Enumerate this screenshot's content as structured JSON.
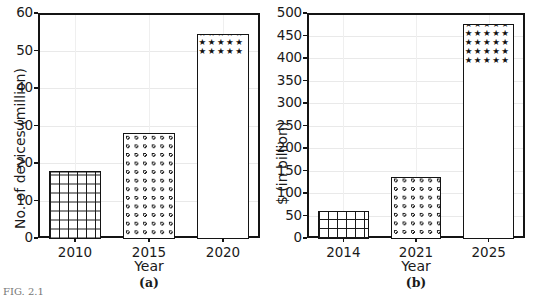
{
  "figure": {
    "background": "#ffffff",
    "axis_color": "#141414",
    "grid_color": "#e9e9e9",
    "bottom_fragment": "FIG. 2.1"
  },
  "chart_data": [
    {
      "id": "a",
      "type": "bar",
      "title": "",
      "panel_caption": "(a)",
      "categories": [
        "2010",
        "2015",
        "2020"
      ],
      "values": [
        18,
        28,
        54.5
      ],
      "xlabel": "Year",
      "ylabel": "No. of devices (million)",
      "ylim": [
        0,
        60
      ],
      "yticks": [
        0,
        10,
        20,
        30,
        40,
        50,
        60
      ],
      "ytick_labels": [
        "0",
        "10",
        "20",
        "30",
        "40",
        "50",
        "60"
      ],
      "grid": true,
      "legend": "none",
      "bar_fills": [
        "grid",
        "circles",
        "stars"
      ]
    },
    {
      "id": "b",
      "type": "bar",
      "title": "",
      "panel_caption": "(b)",
      "categories": [
        "2014",
        "2021",
        "2025"
      ],
      "values": [
        60,
        135,
        475
      ],
      "xlabel": "Year",
      "ylabel": "$ (in billion)",
      "ylim": [
        0,
        500
      ],
      "yticks": [
        0,
        50,
        100,
        150,
        200,
        250,
        300,
        350,
        400,
        450,
        500
      ],
      "ytick_labels": [
        "0",
        "50",
        "100",
        "150",
        "200",
        "250",
        "300",
        "350",
        "400",
        "450",
        "500"
      ],
      "grid": true,
      "legend": "none",
      "bar_fills": [
        "grid",
        "circles",
        "stars"
      ]
    }
  ]
}
